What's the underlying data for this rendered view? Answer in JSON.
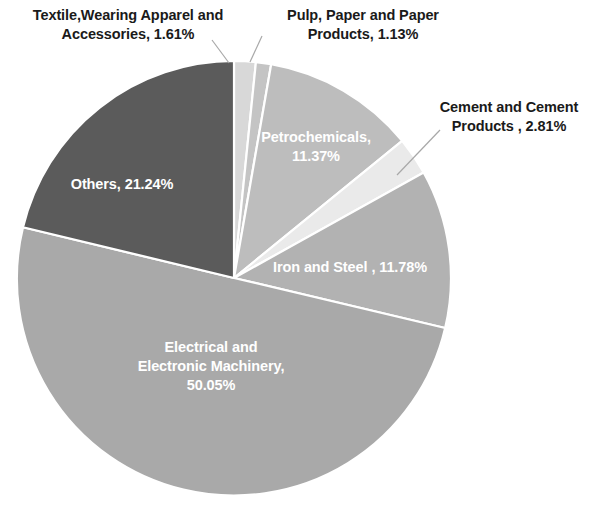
{
  "chart_data": {
    "type": "pie",
    "title": "",
    "subtitle": "",
    "xlabel": "",
    "ylabel": "",
    "legend_position": "none",
    "grid": false,
    "units": "percent",
    "total": 99.99,
    "start_angle_deg": 0,
    "direction": "clockwise",
    "categories": [
      "Textile,Wearing Apparel and Accessories",
      "Pulp, Paper and Paper Products",
      "Petrochemicals",
      "Cement and Cement Products",
      "Iron and Steel",
      "Electrical and Electronic Machinery",
      "Others"
    ],
    "values": [
      1.61,
      1.13,
      11.37,
      2.81,
      11.78,
      50.05,
      21.24
    ],
    "slices": [
      {
        "key": "textile",
        "name": "Textile,Wearing Apparel and Accessories",
        "value": 1.61,
        "label": "Textile,Wearing Apparel and\nAccessories, 1.61%",
        "value_label": "1.61%",
        "color": "#d8d8d8",
        "label_placement": "outside",
        "text_color": "#1a1a1a"
      },
      {
        "key": "pulp",
        "name": "Pulp, Paper and Paper Products",
        "value": 1.13,
        "label": "Pulp, Paper and Paper\nProducts, 1.13%",
        "value_label": "1.13%",
        "color": "#c4c4c4",
        "label_placement": "outside",
        "text_color": "#1a1a1a"
      },
      {
        "key": "petrochemicals",
        "name": "Petrochemicals",
        "value": 11.37,
        "label": "Petrochemicals,\n11.37%",
        "value_label": "11.37%",
        "color": "#bdbdbd",
        "label_placement": "inside",
        "text_color": "#ffffff"
      },
      {
        "key": "cement",
        "name": "Cement and Cement Products",
        "value": 2.81,
        "label": "Cement and Cement\nProducts , 2.81%",
        "value_label": "2.81%",
        "color": "#eaeaea",
        "label_placement": "outside",
        "text_color": "#1a1a1a"
      },
      {
        "key": "iron_steel",
        "name": "Iron and Steel",
        "value": 11.78,
        "label": "Iron and Steel , 11.78%",
        "value_label": "11.78%",
        "color": "#b2b2b2",
        "label_placement": "inside",
        "text_color": "#ffffff"
      },
      {
        "key": "electrical",
        "name": "Electrical and Electronic Machinery",
        "value": 50.05,
        "label": "Electrical and\nElectronic Machinery,\n50.05%",
        "value_label": "50.05%",
        "color": "#a9a9a9",
        "label_placement": "inside",
        "text_color": "#ffffff"
      },
      {
        "key": "others",
        "name": "Others",
        "value": 21.24,
        "label": "Others, 21.24%",
        "value_label": "21.24%",
        "color": "#5b5b5b",
        "label_placement": "inside",
        "text_color": "#ffffff"
      }
    ],
    "colors": {
      "background": "#ffffff",
      "slice_border": "#ffffff",
      "leader_line": "#aaaaaa",
      "outside_text": "#1a1a1a",
      "inside_text": "#ffffff"
    }
  }
}
